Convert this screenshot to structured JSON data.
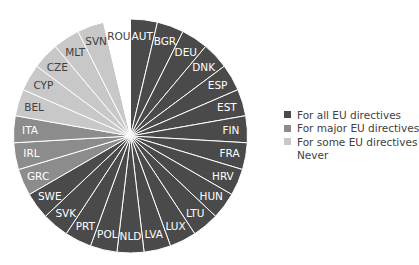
{
  "chart_data": {
    "type": "pie",
    "title": "",
    "categories": [
      "AUT",
      "BGR",
      "DEU",
      "DNK",
      "ESP",
      "EST",
      "FIN",
      "FRA",
      "HRV",
      "HUN",
      "LTU",
      "LUX",
      "LVA",
      "NLD",
      "POL",
      "PRT",
      "SVK",
      "SWE",
      "GRC",
      "IRL",
      "ITA",
      "BEL",
      "CYP",
      "CZE",
      "MLT",
      "SVN",
      "ROU"
    ],
    "values": [
      1,
      1,
      1,
      1,
      1,
      1,
      1,
      1,
      1,
      1,
      1,
      1,
      1,
      1,
      1,
      1,
      1,
      1,
      1,
      1,
      1,
      1,
      1,
      1,
      1,
      1,
      1
    ],
    "groups": [
      "all",
      "all",
      "all",
      "all",
      "all",
      "all",
      "all",
      "all",
      "all",
      "all",
      "all",
      "all",
      "all",
      "all",
      "all",
      "all",
      "all",
      "all",
      "major",
      "major",
      "major",
      "some",
      "some",
      "some",
      "some",
      "some",
      "never"
    ],
    "start_angle_deg": 0,
    "direction": "clockwise",
    "legend": [
      {
        "key": "all",
        "label": "For all EU directives",
        "color": "#4a4a4a"
      },
      {
        "key": "major",
        "label": "For major EU directives",
        "color": "#8c8c8c"
      },
      {
        "key": "some",
        "label": "For some EU directives",
        "color": "#c8c8c8"
      },
      {
        "key": "never",
        "label": "Never",
        "color": "#ffffff"
      }
    ],
    "legend_position": "right",
    "label_colors": {
      "all": "#ffffff",
      "major": "#ffffff",
      "some": "#404040",
      "never": "#404040"
    }
  }
}
